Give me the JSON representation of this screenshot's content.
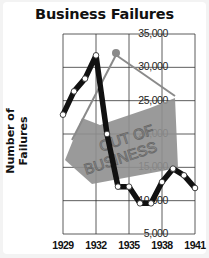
{
  "chart_data": {
    "type": "line",
    "title": "Business Failures",
    "xlabel": "",
    "ylabel": "Number of Failures",
    "x": [
      1929,
      1930,
      1931,
      1932,
      1933,
      1934,
      1935,
      1936,
      1937,
      1938,
      1939,
      1940,
      1941
    ],
    "series": [
      {
        "name": "Business Failures",
        "values": [
          22900,
          26400,
          28300,
          31800,
          20000,
          12100,
          12100,
          9600,
          9600,
          12800,
          14800,
          13800,
          11900
        ]
      }
    ],
    "x_tick_labels": [
      "1929",
      "1932",
      "1935",
      "1938",
      "1941"
    ],
    "y_tick_labels": [
      "35,000",
      "30,000",
      "25,000",
      "20,000",
      "15,000",
      "10,000",
      "5,000"
    ],
    "ylim": [
      5000,
      35000
    ],
    "xlim": [
      1929,
      1941
    ],
    "grid": true,
    "legend": null,
    "annotations": [
      "OUT OF BUSINESS (hanging sign illustration)"
    ]
  },
  "colors": {
    "line": "#111111",
    "marker_fill": "#ffffff",
    "sign": "#8f8f8f",
    "sign_text": "#6a6a6a",
    "grid": "#333333"
  },
  "sign": {
    "line1": "OUT OF",
    "line2": "BUSINESS"
  }
}
